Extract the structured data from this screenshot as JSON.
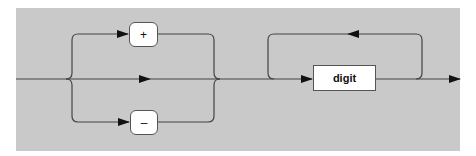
{
  "diagram": {
    "type": "syntax-railroad-diagram",
    "background_color": "#c9c9c9",
    "line_color": "#333333",
    "sign_group": {
      "options": [
        {
          "kind": "terminal",
          "label": "+"
        },
        {
          "kind": "skip",
          "label": ""
        },
        {
          "kind": "terminal",
          "label": "–"
        }
      ]
    },
    "repeat_group": {
      "item": {
        "kind": "nonterminal",
        "label": "digit"
      },
      "repeatable": true
    }
  }
}
